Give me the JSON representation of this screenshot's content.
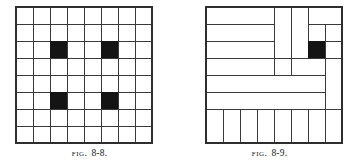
{
  "page": {
    "background_color": "#ffffff",
    "width": 359,
    "height": 168
  },
  "style": {
    "line_color": "#3a3a3a",
    "border_color": "#2e2e2e",
    "fill_color": "#141414",
    "cell_background": "#ffffff",
    "line_width": 1,
    "border_width": 1.4
  },
  "figures": [
    {
      "id": "fig-8-8",
      "caption_label": "Fig.",
      "caption_number": "8-8.",
      "grid": {
        "rows": 8,
        "cols": 8,
        "cell_size": 17
      },
      "description": "Eight by eight checkerboard grid with four shaded squares",
      "shaded_cells": [
        {
          "row": 3,
          "col": 3
        },
        {
          "row": 3,
          "col": 6
        },
        {
          "row": 6,
          "col": 3
        },
        {
          "row": 6,
          "col": 6
        }
      ],
      "tiles": []
    },
    {
      "id": "fig-8-9",
      "caption_label": "Fig.",
      "caption_number": "8-9.",
      "grid": {
        "rows": 8,
        "cols": 8,
        "cell_size": 17
      },
      "description": "Eight by eight board tiled by 1x4 tetrominoes in a pinwheel arrangement with one shaded square",
      "shaded_cells": [
        {
          "row": 3,
          "col": 7
        }
      ],
      "tiles": [
        {
          "row": 1,
          "col": 1,
          "w": 4,
          "h": 1,
          "orient": "horizontal"
        },
        {
          "row": 2,
          "col": 1,
          "w": 4,
          "h": 1,
          "orient": "horizontal"
        },
        {
          "row": 3,
          "col": 1,
          "w": 4,
          "h": 1,
          "orient": "horizontal"
        },
        {
          "row": 1,
          "col": 5,
          "w": 1,
          "h": 4,
          "orient": "vertical"
        },
        {
          "row": 1,
          "col": 6,
          "w": 1,
          "h": 4,
          "orient": "vertical"
        },
        {
          "row": 1,
          "col": 7,
          "w": 2,
          "h": 1,
          "orient": "horizontal"
        },
        {
          "row": 1,
          "col": 7,
          "w": 2,
          "h": 1,
          "orient": "horizontal-upper"
        },
        {
          "row": 2,
          "col": 7,
          "w": 2,
          "h": 1,
          "orient": "horizontal"
        },
        {
          "row": 3,
          "col": 8,
          "w": 1,
          "h": 4,
          "orient": "vertical"
        },
        {
          "row": 4,
          "col": 1,
          "w": 6,
          "h": 1,
          "orient": "horizontal"
        },
        {
          "row": 5,
          "col": 1,
          "w": 6,
          "h": 1,
          "orient": "horizontal"
        },
        {
          "row": 4,
          "col": 7,
          "w": 1,
          "h": 2,
          "orient": "vertical"
        },
        {
          "row": 5,
          "col": 1,
          "w": 1,
          "h": 4,
          "orient": "vertical"
        },
        {
          "row": 6,
          "col": 2,
          "w": 1,
          "h": 3,
          "orient": "vertical"
        },
        {
          "row": 6,
          "col": 3,
          "w": 1,
          "h": 3,
          "orient": "vertical"
        },
        {
          "row": 6,
          "col": 4,
          "w": 1,
          "h": 3,
          "orient": "vertical"
        },
        {
          "row": 6,
          "col": 5,
          "w": 1,
          "h": 3,
          "orient": "vertical"
        },
        {
          "row": 6,
          "col": 6,
          "w": 1,
          "h": 3,
          "orient": "vertical"
        },
        {
          "row": 6,
          "col": 7,
          "w": 1,
          "h": 3,
          "orient": "vertical"
        }
      ]
    }
  ]
}
